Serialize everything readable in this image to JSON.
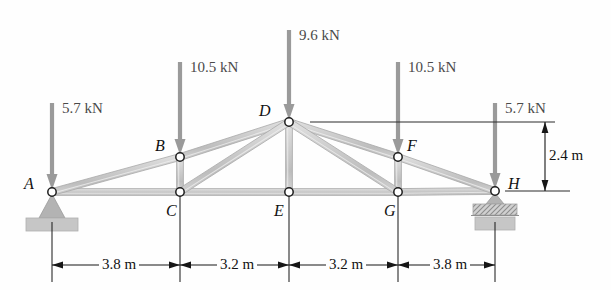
{
  "figure": {
    "type": "truss-free-body-diagram",
    "units": "m / kN",
    "colors": {
      "member_fill": "#c9c9c9",
      "member_stroke": "#a8a8a8",
      "arrow": "#9a9a9a",
      "support": "#b0b0b0",
      "ground": "#c4c4c4",
      "dimension": "#161616",
      "joint_ring": "#1d1d1d",
      "background": "#fefefe"
    }
  },
  "joints": [
    {
      "id": "A",
      "label": "A",
      "x": 52,
      "y": 192,
      "label_x": 24,
      "label_y": 176
    },
    {
      "id": "B",
      "label": "B",
      "x": 180,
      "y": 157,
      "label_x": 155,
      "label_y": 138
    },
    {
      "id": "C",
      "label": "C",
      "x": 180,
      "y": 192,
      "label_x": 166,
      "label_y": 203
    },
    {
      "id": "D",
      "label": "D",
      "x": 289,
      "y": 122,
      "label_x": 259,
      "label_y": 103
    },
    {
      "id": "E",
      "label": "E",
      "x": 289,
      "y": 192,
      "label_x": 274,
      "label_y": 203
    },
    {
      "id": "F",
      "label": "F",
      "x": 398,
      "y": 157,
      "label_x": 407,
      "label_y": 138
    },
    {
      "id": "G",
      "label": "G",
      "x": 398,
      "y": 192,
      "label_x": 384,
      "label_y": 203
    },
    {
      "id": "H",
      "label": "H",
      "x": 495,
      "y": 191,
      "label_x": 508,
      "label_y": 176
    }
  ],
  "members": [
    {
      "from": "A",
      "to": "C"
    },
    {
      "from": "C",
      "to": "E"
    },
    {
      "from": "E",
      "to": "G"
    },
    {
      "from": "G",
      "to": "H"
    },
    {
      "from": "A",
      "to": "B"
    },
    {
      "from": "B",
      "to": "D"
    },
    {
      "from": "D",
      "to": "F"
    },
    {
      "from": "F",
      "to": "H"
    },
    {
      "from": "B",
      "to": "C"
    },
    {
      "from": "D",
      "to": "E"
    },
    {
      "from": "F",
      "to": "G"
    },
    {
      "from": "C",
      "to": "D"
    },
    {
      "from": "D",
      "to": "G"
    }
  ],
  "loads": [
    {
      "at": "A",
      "value": "5.7 kN",
      "x": 52,
      "tail_y": 103,
      "head_y": 190,
      "label_x": 62,
      "label_y": 101
    },
    {
      "at": "B",
      "value": "10.5 kN",
      "x": 180,
      "tail_y": 62,
      "head_y": 155,
      "label_x": 190,
      "label_y": 60
    },
    {
      "at": "D",
      "value": "9.6 kN",
      "x": 289,
      "tail_y": 30,
      "head_y": 120,
      "label_x": 299,
      "label_y": 28
    },
    {
      "at": "F",
      "value": "10.5 kN",
      "x": 398,
      "tail_y": 62,
      "head_y": 155,
      "label_x": 408,
      "label_y": 60
    },
    {
      "at": "H",
      "value": "5.7 kN",
      "x": 495,
      "tail_y": 103,
      "head_y": 189,
      "label_x": 505,
      "label_y": 101
    }
  ],
  "supports": [
    {
      "at": "A",
      "kind": "pin-support",
      "x": 52,
      "y": 192
    },
    {
      "at": "H",
      "kind": "roller-support",
      "x": 495,
      "y": 191
    }
  ],
  "horizontal_dimensions": [
    {
      "label": "3.8 m",
      "from_x": 52,
      "to_x": 180,
      "y": 265,
      "label_x": 116,
      "label_y": 257
    },
    {
      "label": "3.2 m",
      "from_x": 180,
      "to_x": 289,
      "y": 265,
      "label_x": 234,
      "label_y": 257
    },
    {
      "label": "3.2 m",
      "from_x": 289,
      "to_x": 398,
      "y": 265,
      "label_x": 343,
      "label_y": 257
    },
    {
      "label": "3.8 m",
      "from_x": 398,
      "to_x": 495,
      "y": 265,
      "label_x": 447,
      "label_y": 257
    }
  ],
  "vertical_dimensions": [
    {
      "label": "2.4 m",
      "x": 545,
      "from_y": 122,
      "to_y": 191,
      "label_x": 549,
      "label_y": 148
    }
  ],
  "extension_lines": {
    "top": {
      "y": 122,
      "from_x": 310,
      "to_x": 555
    },
    "bottom": {
      "y": 191,
      "from_x": 505,
      "to_x": 570
    }
  }
}
